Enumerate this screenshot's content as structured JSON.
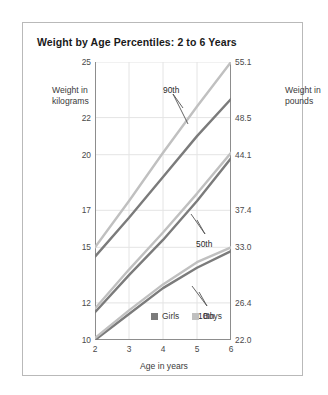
{
  "card": {
    "title": "Weight by Age Percentiles: 2 to 6 Years"
  },
  "axes": {
    "left_title": "Weight in kilograms",
    "right_title": "Weight in pounds",
    "x_title": "Age in years"
  },
  "legend": {
    "items": [
      {
        "label": "Girls",
        "color": "#7b7b7b"
      },
      {
        "label": "Boys",
        "color": "#c0c0c0"
      }
    ]
  },
  "annotations": [
    {
      "label": "90th"
    },
    {
      "label": "50th"
    },
    {
      "label": "10th"
    }
  ],
  "chart_data": {
    "type": "line",
    "title": "Weight by Age Percentiles: 2 to 6 Years",
    "xlabel": "Age in years",
    "ylabel": "Weight in kilograms",
    "y2label": "Weight in pounds",
    "xlim": [
      2,
      6
    ],
    "ylim": [
      10,
      25
    ],
    "grid": true,
    "legend_position": "bottom-center",
    "x": [
      2,
      3,
      4,
      5,
      6
    ],
    "xticks": [
      "2",
      "3",
      "4",
      "5",
      "6"
    ],
    "yticks_kg": [
      "25",
      "22",
      "20",
      "17",
      "15",
      "12",
      "10"
    ],
    "yticks_kg_values": [
      25,
      22,
      20,
      17,
      15,
      12,
      10
    ],
    "yticks_lb": [
      "55.1",
      "48.5",
      "44.1",
      "37.4",
      "33.0",
      "26.4",
      "22.0"
    ],
    "yticks_lb_values": [
      55.1,
      48.5,
      44.1,
      37.4,
      33.0,
      26.4,
      22.0
    ],
    "series": [
      {
        "name": "90th Girls",
        "percentile": "90th",
        "sex": "Girls",
        "color": "#7b7b7b",
        "values": [
          14.5,
          16.6,
          18.8,
          21.0,
          23.0
        ]
      },
      {
        "name": "90th Boys",
        "percentile": "90th",
        "sex": "Boys",
        "color": "#c0c0c0",
        "values": [
          15.0,
          17.5,
          20.1,
          22.6,
          25.0
        ]
      },
      {
        "name": "50th Girls",
        "percentile": "50th",
        "sex": "Girls",
        "color": "#7b7b7b",
        "values": [
          11.5,
          13.5,
          15.4,
          17.5,
          19.8
        ]
      },
      {
        "name": "50th Boys",
        "percentile": "50th",
        "sex": "Boys",
        "color": "#c0c0c0",
        "values": [
          11.7,
          13.8,
          15.8,
          17.9,
          20.1
        ]
      },
      {
        "name": "10th Girls",
        "percentile": "10th",
        "sex": "Girls",
        "color": "#7b7b7b",
        "values": [
          10.0,
          11.4,
          12.8,
          13.9,
          14.8
        ]
      },
      {
        "name": "10th Boys",
        "percentile": "10th",
        "sex": "Boys",
        "color": "#c0c0c0",
        "values": [
          10.1,
          11.6,
          13.0,
          14.2,
          15.0
        ]
      }
    ]
  }
}
